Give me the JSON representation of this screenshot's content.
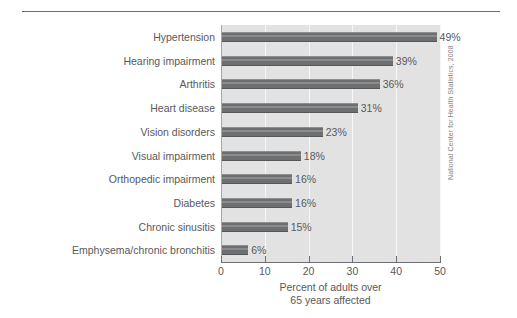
{
  "chart_data": {
    "type": "bar",
    "orientation": "horizontal",
    "title": "",
    "subtitle": "",
    "xlabel": "Percent of adults over 65 years affected",
    "ylabel": "",
    "xlim": [
      0,
      50
    ],
    "xticks": [
      0,
      10,
      20,
      30,
      40,
      50
    ],
    "xtick_labels": [
      "0",
      "10",
      "20",
      "30",
      "40",
      "50"
    ],
    "grid": "vertical-only",
    "legend": "none",
    "categories": [
      "Hypertension",
      "Hearing impairment",
      "Arthritis",
      "Heart disease",
      "Vision disorders",
      "Visual impairment",
      "Orthopedic impairment",
      "Diabetes",
      "Chronic sinusitis",
      "Emphysema/chronic bronchitis"
    ],
    "values": [
      49,
      39,
      36,
      31,
      23,
      18,
      16,
      16,
      15,
      6
    ],
    "data_labels": [
      "49%",
      "39%",
      "36%",
      "31%",
      "23%",
      "18%",
      "16%",
      "16%",
      "15%",
      "6%"
    ],
    "annotations": [
      "National Center for Health Statistics, 2008"
    ],
    "colors": {
      "bar_fill": "#6e6f71",
      "bar_highlight": "#8a8b8d",
      "plot_background": "#e2e2e2",
      "gridline": "#f7f7f7",
      "axis": "#6d6e71",
      "text": "#58595b",
      "credit_text": "#808285"
    }
  },
  "axis": {
    "x_caption_line1": "Percent of adults over",
    "x_caption_line2": "65 years affected"
  },
  "source": {
    "credit": "National Center for Health Statistics, 2008"
  }
}
